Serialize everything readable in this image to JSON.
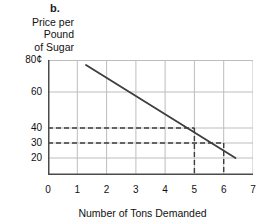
{
  "panel": {
    "letter": "b."
  },
  "axes": {
    "y_title_lines": [
      "Price per",
      "Pound",
      "of Sugar"
    ],
    "x_title": "Number of Tons Demanded"
  },
  "chart_data": {
    "type": "line",
    "title": "",
    "subtitle": "",
    "xlabel": "Number of Tons Demanded",
    "ylabel": "Price per Pound of Sugar",
    "xlim": [
      0,
      7
    ],
    "ylim": [
      0,
      80
    ],
    "xticks": [
      0,
      1,
      2,
      3,
      4,
      5,
      6,
      7
    ],
    "xtick_labels": [
      "0",
      "1",
      "2",
      "3",
      "4",
      "5",
      "6",
      "7"
    ],
    "yticks": [
      80,
      60,
      40,
      30,
      20
    ],
    "ytick_labels": [
      "80¢",
      "60",
      "40",
      "30",
      "20"
    ],
    "grid": true,
    "legend": null,
    "series": [
      {
        "name": "Demand",
        "type": "line",
        "points": [
          [
            1.3,
            80
          ],
          [
            6.4,
            20
          ]
        ]
      }
    ],
    "annotations": [
      {
        "name": "guide-40",
        "style": "dashed",
        "price": 40,
        "quantity": 5,
        "label": ""
      },
      {
        "name": "guide-30",
        "style": "dashed",
        "price": 30,
        "quantity": 6,
        "label": ""
      }
    ],
    "colors": {
      "line": "#3d3d3d",
      "grid": "#bdbdbd",
      "axis": "#4a4a4a",
      "dashed": "#3d3d3d",
      "background": "#ffffff"
    }
  }
}
